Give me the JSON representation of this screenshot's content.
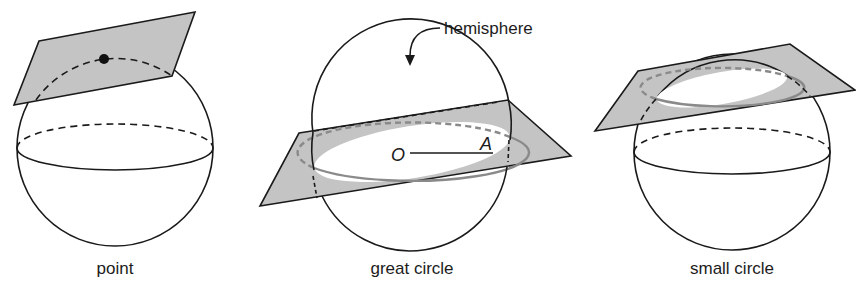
{
  "diagram": {
    "type": "sphere-plane-intersections",
    "colors": {
      "outline": "#1a1a1a",
      "plane_fill": "#c4c4c4",
      "intersection_curve": "#8a8a8a",
      "background": "#ffffff"
    },
    "panels": [
      {
        "id": "point",
        "caption": "point",
        "description": "Plane tangent to sphere touching at a single point"
      },
      {
        "id": "great-circle",
        "caption": "great circle",
        "callout": "hemisphere",
        "center_label": "O",
        "radius_label": "A",
        "description": "Plane through center cuts sphere in a great circle, dividing it into hemispheres"
      },
      {
        "id": "small-circle",
        "caption": "small circle",
        "description": "Plane not through center cuts sphere in a small circle"
      }
    ]
  }
}
